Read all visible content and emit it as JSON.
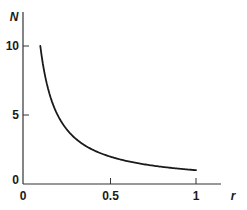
{
  "chart_data": {
    "type": "line",
    "title": "",
    "xlabel": "r",
    "ylabel": "N",
    "xlim": [
      0,
      1.1
    ],
    "ylim": [
      0,
      12
    ],
    "grid": false,
    "legend": null,
    "x_ticks": [
      0,
      0.5,
      1
    ],
    "x_tick_labels": [
      "0",
      "0.5",
      "1"
    ],
    "y_ticks": [
      0,
      5,
      10
    ],
    "y_tick_labels": [
      "0",
      "5",
      "10"
    ],
    "series": [
      {
        "name": "N = 1/r",
        "color": "#1a1a1a",
        "x": [
          0.1,
          0.12,
          0.15,
          0.2,
          0.25,
          0.3,
          0.4,
          0.5,
          0.6,
          0.7,
          0.8,
          0.9,
          1.0
        ],
        "values": [
          10,
          8.33,
          6.67,
          5,
          4,
          3.33,
          2.5,
          2,
          1.67,
          1.43,
          1.25,
          1.11,
          1.0
        ]
      }
    ]
  },
  "labels": {
    "x_axis": "r",
    "y_axis": "N",
    "x_ticks": [
      "0",
      "0.5",
      "1"
    ],
    "y_ticks": [
      "0",
      "5",
      "10"
    ]
  }
}
